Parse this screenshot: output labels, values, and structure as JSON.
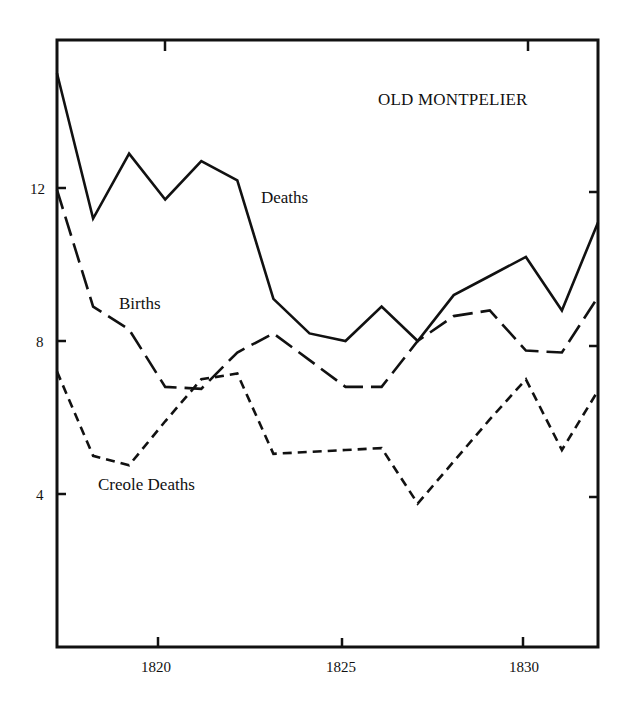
{
  "chart_data": {
    "type": "line",
    "title": "OLD MONTPELIER",
    "xlabel": "",
    "ylabel": "",
    "x": [
      1817,
      1818,
      1819,
      1820,
      1821,
      1822,
      1823,
      1824,
      1825,
      1826,
      1827,
      1828,
      1829,
      1830,
      1831,
      1832
    ],
    "xlim": [
      1817,
      1832
    ],
    "ylim": [
      0,
      15.9
    ],
    "xticks": [
      1820,
      1825,
      1830
    ],
    "xtick_labels": [
      "1820",
      "1825",
      "1830"
    ],
    "yticks": [
      4,
      8,
      12
    ],
    "ytick_labels": [
      "4",
      "8",
      "12"
    ],
    "grid": false,
    "legend": "inline labels",
    "series": [
      {
        "name": "Deaths",
        "style": "solid",
        "values": [
          15.0,
          11.2,
          12.9,
          11.7,
          12.7,
          12.2,
          9.1,
          8.2,
          8.0,
          8.9,
          8.0,
          9.2,
          9.7,
          10.2,
          8.8,
          11.1
        ]
      },
      {
        "name": "Births",
        "style": "long-dash",
        "values": [
          11.95,
          8.9,
          8.3,
          6.8,
          6.75,
          7.7,
          8.2,
          7.5,
          6.8,
          6.8,
          8.0,
          8.65,
          8.8,
          7.75,
          7.7,
          9.15
        ]
      },
      {
        "name": "Creole Deaths",
        "style": "short-dash",
        "values": [
          7.2,
          5.0,
          4.75,
          5.9,
          7.0,
          7.15,
          5.05,
          5.1,
          5.15,
          5.2,
          3.75,
          4.85,
          5.95,
          7.0,
          5.15,
          6.7
        ]
      }
    ],
    "annotations": [
      {
        "text": "OLD MONTPELIER",
        "position": "top-right"
      },
      {
        "text": "Deaths",
        "near_year": 1823,
        "near_value": 12.0
      },
      {
        "text": "Births",
        "near_year": 1819.5,
        "near_value": 9.8
      },
      {
        "text": "Creole Deaths",
        "near_year": 1820.5,
        "near_value": 4.1
      }
    ]
  },
  "labels": {
    "title": "OLD MONTPELIER",
    "deaths": "Deaths",
    "births": "Births",
    "creole": "Creole Deaths",
    "y12": "12",
    "y8": "8",
    "y4": "4",
    "x1820": "1820",
    "x1825": "1825",
    "x1830": "1830"
  }
}
